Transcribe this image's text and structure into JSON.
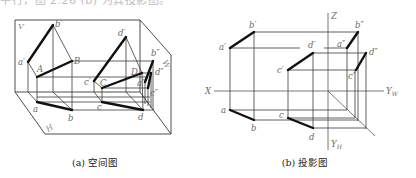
{
  "top_text": "平行，图 2.26 (b) 为其投影图。",
  "figure_a": {
    "caption": "(a) 空间图",
    "planes": {
      "V": "V",
      "H": "H",
      "W": "W"
    },
    "labels": {
      "b_v": "b′",
      "a_v": "a′",
      "A": "A",
      "B": "B",
      "a_h": "a",
      "b_h": "b",
      "d_v": "d′",
      "c_v": "c′",
      "C": "C",
      "D": "D",
      "c_h": "c",
      "d_h": "d",
      "b_w": "b″",
      "a_w": "a″",
      "d_w": "d″",
      "c_w": "c″"
    }
  },
  "figure_b": {
    "caption": "(b) 投影图",
    "axes": {
      "X": "X",
      "Z": "Z",
      "YW_main": "Y",
      "YW_sub": "W",
      "YH_main": "Y",
      "YH_sub": "H"
    },
    "labels": {
      "b_v": "b′",
      "a_v": "a′",
      "d_v": "d′",
      "c_v": "c′",
      "b_w": "b″",
      "a_w": "a″",
      "d_w": "d″",
      "c_w": "c″",
      "a_h": "a",
      "b_h": "b",
      "c_h": "c",
      "d_h": "d"
    }
  }
}
